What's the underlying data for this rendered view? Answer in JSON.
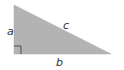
{
  "diagram": {
    "type": "right-triangle",
    "fill_color": "#b3b3b3",
    "marker_color": "#444444",
    "label_color": "#333333",
    "vertices": {
      "top": [
        14,
        5
      ],
      "right_angle": [
        14,
        54
      ],
      "right": [
        111,
        54
      ]
    },
    "labels": {
      "a": "a",
      "b": "b",
      "c": "c"
    },
    "right_angle_marker": true
  }
}
